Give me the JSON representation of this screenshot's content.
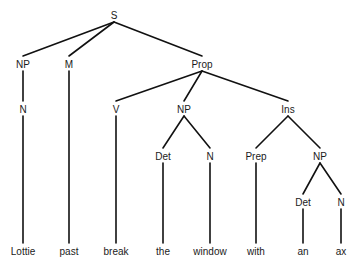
{
  "diagram": {
    "type": "syntax-tree",
    "colors": {
      "line": "#111111",
      "text": "#1a1a1a",
      "background": "#ffffff"
    },
    "nodes": [
      {
        "id": "S",
        "label": "S",
        "x": 114,
        "y": 16
      },
      {
        "id": "NP1",
        "label": "NP",
        "x": 23,
        "y": 65
      },
      {
        "id": "M",
        "label": "M",
        "x": 69,
        "y": 65
      },
      {
        "id": "Prop",
        "label": "Prop",
        "x": 202,
        "y": 65
      },
      {
        "id": "N1",
        "label": "N",
        "x": 23,
        "y": 110
      },
      {
        "id": "V",
        "label": "V",
        "x": 116,
        "y": 110
      },
      {
        "id": "NP2",
        "label": "NP",
        "x": 184,
        "y": 110
      },
      {
        "id": "Ins",
        "label": "Ins",
        "x": 288,
        "y": 110
      },
      {
        "id": "Det1",
        "label": "Det",
        "x": 163,
        "y": 157
      },
      {
        "id": "N2",
        "label": "N",
        "x": 210,
        "y": 157
      },
      {
        "id": "Prep",
        "label": "Prep",
        "x": 256,
        "y": 157
      },
      {
        "id": "NP3",
        "label": "NP",
        "x": 320,
        "y": 157
      },
      {
        "id": "Det2",
        "label": "Det",
        "x": 303,
        "y": 203
      },
      {
        "id": "N3",
        "label": "N",
        "x": 341,
        "y": 203
      },
      {
        "id": "w1",
        "label": "Lottie",
        "x": 23,
        "y": 252
      },
      {
        "id": "w2",
        "label": "past",
        "x": 69,
        "y": 252
      },
      {
        "id": "w3",
        "label": "break",
        "x": 116,
        "y": 252
      },
      {
        "id": "w4",
        "label": "the",
        "x": 163,
        "y": 252
      },
      {
        "id": "w5",
        "label": "window",
        "x": 210,
        "y": 252
      },
      {
        "id": "w6",
        "label": "with",
        "x": 256,
        "y": 252
      },
      {
        "id": "w7",
        "label": "an",
        "x": 303,
        "y": 252
      },
      {
        "id": "w8",
        "label": "ax",
        "x": 341,
        "y": 252
      }
    ],
    "edges": [
      [
        "S",
        "NP1"
      ],
      [
        "S",
        "M"
      ],
      [
        "S",
        "Prop"
      ],
      [
        "NP1",
        "N1"
      ],
      [
        "N1",
        "w1"
      ],
      [
        "M",
        "w2"
      ],
      [
        "Prop",
        "V"
      ],
      [
        "Prop",
        "NP2"
      ],
      [
        "Prop",
        "Ins"
      ],
      [
        "V",
        "w3"
      ],
      [
        "NP2",
        "Det1"
      ],
      [
        "NP2",
        "N2"
      ],
      [
        "Det1",
        "w4"
      ],
      [
        "N2",
        "w5"
      ],
      [
        "Ins",
        "Prep"
      ],
      [
        "Ins",
        "NP3"
      ],
      [
        "Prep",
        "w6"
      ],
      [
        "NP3",
        "Det2"
      ],
      [
        "NP3",
        "N3"
      ],
      [
        "Det2",
        "w7"
      ],
      [
        "N3",
        "w8"
      ]
    ]
  }
}
